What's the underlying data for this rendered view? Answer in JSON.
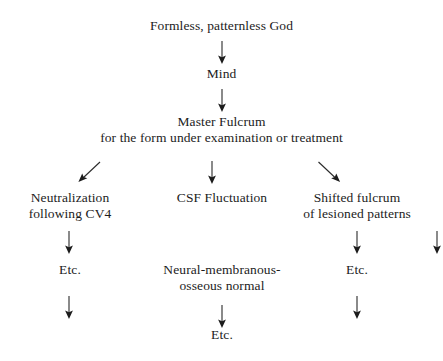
{
  "diagram": {
    "type": "flowchart",
    "orientation": "top-down",
    "background_color": "#ffffff",
    "text_color": "#1c1c1c",
    "arrow_color": "#1c1c1c",
    "nodes": {
      "root": {
        "line1": "Formless, patternless God"
      },
      "mind": {
        "line1": "Mind"
      },
      "master_fulcrum": {
        "line1": "Master Fulcrum",
        "line2": "for the form under examination or treatment"
      },
      "branch_left": {
        "line1": "Neutralization",
        "line2": "following CV4"
      },
      "branch_center": {
        "line1": "CSF Fluctuation"
      },
      "branch_right": {
        "line1": "Shifted fulcrum",
        "line2": "of lesioned patterns"
      },
      "left_etc": {
        "line1": "Etc."
      },
      "center_normal": {
        "line1": "Neural-membranous-",
        "line2": "osseous normal"
      },
      "right_etc": {
        "line1": "Etc."
      },
      "center_etc": {
        "line1": "Etc."
      }
    },
    "arrows": {
      "root_to_mind": {
        "glyph": "down-arrow",
        "direction": "down"
      },
      "mind_to_master": {
        "glyph": "down-arrow",
        "direction": "down"
      },
      "master_to_left": {
        "glyph": "down-left-arrow",
        "direction": "down-left"
      },
      "master_to_center": {
        "glyph": "down-arrow",
        "direction": "down"
      },
      "master_to_right": {
        "glyph": "down-right-arrow",
        "direction": "down-right"
      },
      "left_to_etc": {
        "glyph": "down-arrow",
        "direction": "down"
      },
      "center_to_normal": {
        "glyph": "down-arrow",
        "direction": "down"
      },
      "right_to_etc": {
        "glyph": "down-arrow",
        "direction": "down"
      },
      "left_etc_down": {
        "glyph": "down-arrow",
        "direction": "down"
      },
      "center_normal_to_etc": {
        "glyph": "down-arrow",
        "direction": "down"
      },
      "right_etc_down": {
        "glyph": "down-arrow",
        "direction": "down"
      }
    }
  }
}
